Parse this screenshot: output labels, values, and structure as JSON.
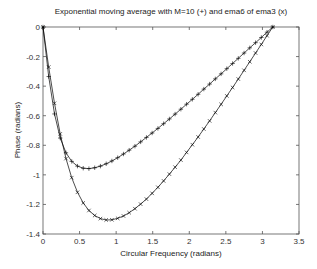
{
  "chart_data": {
    "type": "line",
    "title": "Exponential moving average with M=10 (+) and ema6 of ema3 (x)",
    "xlabel": "Circular Frequency  (radians)",
    "ylabel": "Phase  (radians)",
    "xlim": [
      0,
      3.5
    ],
    "ylim": [
      -1.4,
      0
    ],
    "xticks": [
      0,
      0.5,
      1,
      1.5,
      2,
      2.5,
      3,
      3.5
    ],
    "xtick_labels": [
      "0",
      "0.5",
      "1",
      "1.5",
      "2",
      "2.5",
      "3",
      "3.5"
    ],
    "yticks": [
      0,
      -0.2,
      -0.4,
      -0.6,
      -0.8,
      -1,
      -1.2,
      -1.4
    ],
    "ytick_labels": [
      "0",
      "-0.2",
      "-0.4",
      "-0.6",
      "-0.8",
      "-1",
      "-1.2",
      "-1.4"
    ],
    "grid": false,
    "legend": null,
    "x": [
      0,
      0.0785,
      0.157,
      0.2356,
      0.314,
      0.3927,
      0.471,
      0.55,
      0.628,
      0.707,
      0.785,
      0.864,
      0.942,
      1.021,
      1.1,
      1.178,
      1.257,
      1.335,
      1.414,
      1.492,
      1.571,
      1.649,
      1.728,
      1.806,
      1.885,
      1.963,
      2.042,
      2.121,
      2.199,
      2.278,
      2.356,
      2.435,
      2.513,
      2.592,
      2.67,
      2.749,
      2.827,
      2.906,
      2.985,
      3.063,
      3.142
    ],
    "series": [
      {
        "name": "EMA M=10",
        "marker": "+",
        "color": "#000000",
        "values": [
          0,
          -0.335,
          -0.588,
          -0.751,
          -0.851,
          -0.909,
          -0.941,
          -0.955,
          -0.958,
          -0.952,
          -0.941,
          -0.925,
          -0.906,
          -0.884,
          -0.859,
          -0.833,
          -0.806,
          -0.777,
          -0.747,
          -0.717,
          -0.686,
          -0.654,
          -0.622,
          -0.589,
          -0.556,
          -0.522,
          -0.489,
          -0.455,
          -0.42,
          -0.386,
          -0.351,
          -0.317,
          -0.282,
          -0.247,
          -0.212,
          -0.176,
          -0.141,
          -0.106,
          -0.071,
          -0.035,
          0
        ]
      },
      {
        "name": "ema6 of ema3",
        "marker": "x",
        "color": "#000000",
        "values": [
          0,
          -0.271,
          -0.516,
          -0.723,
          -0.89,
          -1.019,
          -1.118,
          -1.19,
          -1.241,
          -1.275,
          -1.296,
          -1.305,
          -1.304,
          -1.294,
          -1.278,
          -1.256,
          -1.229,
          -1.198,
          -1.164,
          -1.125,
          -1.084,
          -1.041,
          -0.995,
          -0.948,
          -0.9,
          -0.848,
          -0.796,
          -0.744,
          -0.69,
          -0.635,
          -0.579,
          -0.523,
          -0.466,
          -0.409,
          -0.352,
          -0.293,
          -0.235,
          -0.176,
          -0.118,
          -0.059,
          0
        ]
      }
    ]
  }
}
